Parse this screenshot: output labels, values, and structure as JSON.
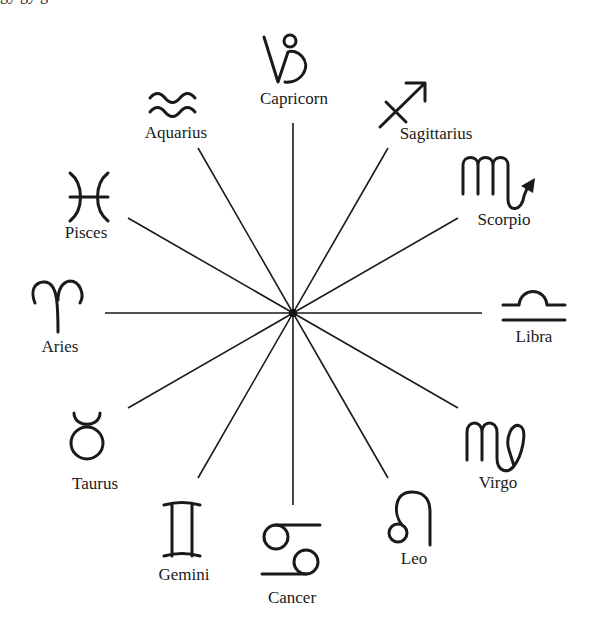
{
  "diagram": {
    "cropped_top_text": "gy                    gy                                                   g",
    "center": {
      "x": 293,
      "y": 313
    },
    "spoke_count": 12,
    "spoke_radius": 190,
    "line_color": "#1a1a1a",
    "signs": [
      {
        "name": "Capricorn",
        "glyph": "capricorn-glyph",
        "position": "top"
      },
      {
        "name": "Sagittarius",
        "glyph": "sagittarius-glyph",
        "position": "top-right-1"
      },
      {
        "name": "Scorpio",
        "glyph": "scorpio-glyph",
        "position": "top-right-2"
      },
      {
        "name": "Libra",
        "glyph": "libra-glyph",
        "position": "right"
      },
      {
        "name": "Virgo",
        "glyph": "virgo-glyph",
        "position": "bottom-right-2"
      },
      {
        "name": "Leo",
        "glyph": "leo-glyph",
        "position": "bottom-right-1"
      },
      {
        "name": "Cancer",
        "glyph": "cancer-glyph",
        "position": "bottom"
      },
      {
        "name": "Gemini",
        "glyph": "gemini-glyph",
        "position": "bottom-left-1"
      },
      {
        "name": "Taurus",
        "glyph": "taurus-glyph",
        "position": "bottom-left-2"
      },
      {
        "name": "Aries",
        "glyph": "aries-glyph",
        "position": "left"
      },
      {
        "name": "Pisces",
        "glyph": "pisces-glyph",
        "position": "top-left-2"
      },
      {
        "name": "Aquarius",
        "glyph": "aquarius-glyph",
        "position": "top-left-1"
      }
    ]
  }
}
